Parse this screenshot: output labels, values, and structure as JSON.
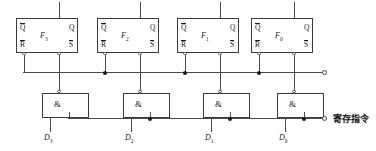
{
  "diagram": {
    "flipflops": [
      {
        "name": "F",
        "index": "3",
        "pin_qbar": "Q",
        "pin_q": "Q",
        "pin_rbar": "R",
        "pin_sbar": "S"
      },
      {
        "name": "F",
        "index": "2",
        "pin_qbar": "Q",
        "pin_q": "Q",
        "pin_rbar": "R",
        "pin_sbar": "S"
      },
      {
        "name": "F",
        "index": "1",
        "pin_qbar": "Q",
        "pin_q": "Q",
        "pin_rbar": "R",
        "pin_sbar": "S"
      },
      {
        "name": "F",
        "index": "0",
        "pin_qbar": "Q",
        "pin_q": "Q",
        "pin_rbar": "R",
        "pin_sbar": "S"
      }
    ],
    "gates": [
      {
        "symbol": "&",
        "input_label": "D",
        "input_index": "3"
      },
      {
        "symbol": "&",
        "input_label": "D",
        "input_index": "2"
      },
      {
        "symbol": "&",
        "input_label": "D",
        "input_index": "1"
      },
      {
        "symbol": "&",
        "input_label": "D",
        "input_index": "0"
      }
    ],
    "control_line_label": "寄存指令",
    "colors": {
      "wire": "#4a4a4a",
      "outline": "#3a3a3a",
      "text": "#1a1a1a"
    }
  }
}
